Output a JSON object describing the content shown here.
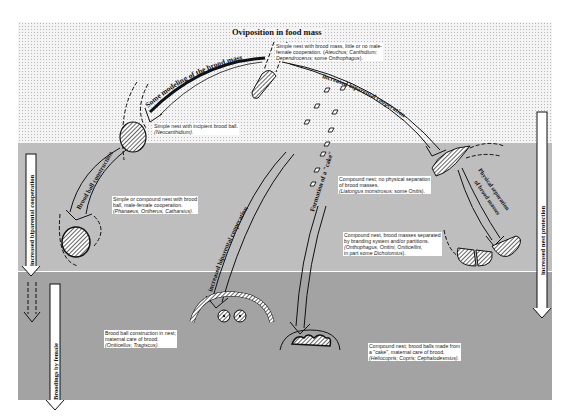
{
  "title": "Oviposition in food mass",
  "zones": [
    {
      "name": "top-zone",
      "pattern": "light dotted"
    },
    {
      "name": "middle-zone",
      "pattern": "medium gray"
    },
    {
      "name": "bottom-zone",
      "pattern": "dark gray"
    }
  ],
  "arrow_labels": {
    "modeling": "Some modeling of the brood mass",
    "biparental_top": "increased biparental cooperation",
    "brood_ball": "Brood ball construction",
    "biparental_mid": "increased biparental cooperation",
    "cake": "Formation of a \"cake\"",
    "separation_1": "Physical separation",
    "separation_2": "of brood masses",
    "left_side": "increased biparental cooperation",
    "left_bottom": "Broodings by female",
    "right_side": "increased nest protection"
  },
  "nests": {
    "simple_brood_mass": {
      "line1": "Simple nest with brood mass, little or no male-",
      "line2_plain": "female cooperation. (",
      "line2_italic": "Ateuchus; Canthidium;",
      "line3_italic1": "Dependrocerus;",
      "line3_plain": " some ",
      "line3_italic2": "Onthophagus",
      "line3_end": ")."
    },
    "incipient_ball": {
      "line1": "Simple nest with incipient brood ball.",
      "line2_italic": "(Neocanthidium)."
    },
    "male_female": {
      "line1": "Simple or compound nest with brood",
      "line2": "ball, male-female cooperation.",
      "line3_italic": "(Phanaeus, Ontherus, Catharsius)."
    },
    "no_separation": {
      "line1": "Compound nest; no physical separation",
      "line2": "of brood masses.",
      "line3_italic": "(Liatongus monstrosus;",
      "line3_plain": " some ",
      "line3_italic2": "Oniti",
      "line3_end": "s)."
    },
    "branding": {
      "line1": "Compound nest, brood masses separated",
      "line2": "by branding system and/or partitions.",
      "line3_italic": "(Onthophagus, Onitini, Oniticellini,",
      "line4_plain": "in part some ",
      "line4_italic": "Dichotomius",
      "line4_end": ")."
    },
    "maternal_ball": {
      "line1": "Brood ball construction in nest;",
      "line2": "maternal care of brood.",
      "line3_italic": "(Oniticellus; Tragiscus)."
    },
    "cake_nest": {
      "line1": "Compound nest; brood balls made from",
      "line2": "a \"cake\", maternal care of brood.",
      "line3_italic": "(Heliocopris; Copris; Cephalodesmius)."
    }
  },
  "colors": {
    "ink": "#111111",
    "band_light": "#f4f4f4",
    "band_medium": "#d9d9d9",
    "band_dark": "#bdbdbd",
    "label_bg": "#ffffff"
  }
}
